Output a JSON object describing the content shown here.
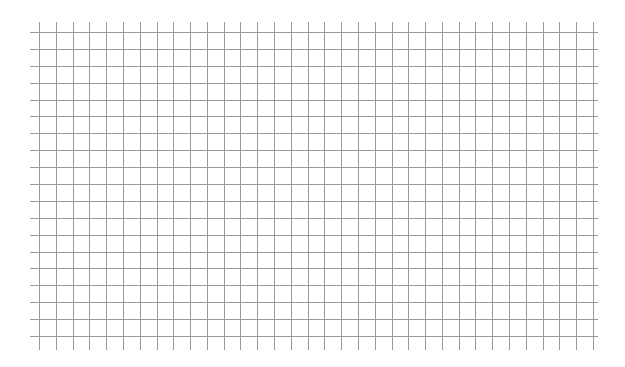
{
  "chart_data": {
    "type": "line",
    "title": "",
    "xlabel": "",
    "ylabel": "",
    "series": [],
    "grid": true,
    "legend": null,
    "tick_labels": "illegible (very faint)",
    "grid_spec": {
      "x_start": 39,
      "x_end": 593,
      "x_count": 34,
      "y_start": 32,
      "y_end": 336,
      "y_count": 19,
      "h_line_left": 30,
      "h_line_right": 598,
      "v_line_top": 22,
      "v_line_bottom": 350,
      "line_color": "#9a9a9a"
    }
  }
}
